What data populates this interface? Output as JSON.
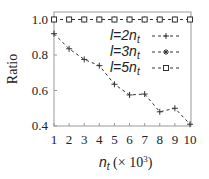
{
  "chart_data": {
    "type": "line",
    "title": "",
    "xlabel": "n_t (× 10^3)",
    "ylabel": "Ratio",
    "x": [
      1,
      2,
      3,
      4,
      5,
      6,
      7,
      8,
      9,
      10
    ],
    "xticks": [
      "1",
      "2",
      "3",
      "4",
      "5",
      "6",
      "7",
      "8",
      "9",
      "10"
    ],
    "yticks": [
      "0.4",
      "0.6",
      "0.8",
      "1.0"
    ],
    "xlim": [
      1,
      10
    ],
    "ylim": [
      0.4,
      1.04
    ],
    "grid": false,
    "legend_position": "upper right (inside)",
    "series": [
      {
        "name": "l=2n_t",
        "marker": "plus",
        "line": "dashed",
        "values": [
          0.92,
          0.835,
          0.775,
          0.74,
          0.635,
          0.575,
          0.58,
          0.48,
          0.5,
          0.41
        ]
      },
      {
        "name": "l=3n_t",
        "marker": "star",
        "line": "dashed",
        "values": [
          1.0,
          1.0,
          1.0,
          1.0,
          1.0,
          1.0,
          1.0,
          1.0,
          1.0,
          1.0
        ]
      },
      {
        "name": "l=5n_t",
        "marker": "square",
        "line": "dashed",
        "values": [
          1.0,
          1.0,
          1.0,
          1.0,
          1.0,
          1.0,
          1.0,
          1.0,
          1.0,
          1.0
        ]
      }
    ]
  },
  "labels": {
    "ylabel": "Ratio",
    "xlabel_main": "n",
    "xlabel_sub": "t",
    "xlabel_rest": " (× 10",
    "xlabel_sup": "3",
    "xlabel_close": ")",
    "legend": [
      {
        "prefix": "l=",
        "mult": "2n",
        "sub": "t"
      },
      {
        "prefix": "l=",
        "mult": "3n",
        "sub": "t"
      },
      {
        "prefix": "l=",
        "mult": "5n",
        "sub": "t"
      }
    ]
  }
}
